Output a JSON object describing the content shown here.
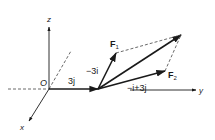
{
  "diagram": {
    "type": "vector-addition-3d",
    "colors": {
      "ink": "#1a1a1a",
      "dashed": "#444444",
      "background": "#ffffff"
    },
    "axes": {
      "origin_label": "O",
      "x_label": "x",
      "y_label": "y",
      "z_label": "z"
    },
    "vectors": {
      "displacement": {
        "label": "3j"
      },
      "f1": {
        "name": "F",
        "subscript": "1",
        "component_label": "−3i"
      },
      "f2": {
        "name": "F",
        "subscript": "2",
        "component_label": "−i+3j"
      }
    }
  }
}
